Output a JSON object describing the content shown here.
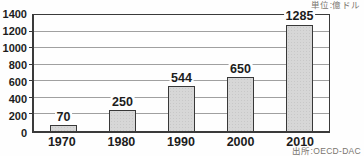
{
  "chart_data": {
    "type": "bar",
    "categories": [
      "1970",
      "1980",
      "1990",
      "2000",
      "2010"
    ],
    "values": [
      70,
      250,
      544,
      650,
      1285
    ],
    "title": "",
    "xlabel": "",
    "ylabel": "",
    "ylim": [
      0,
      1400
    ],
    "yticks": [
      0,
      200,
      400,
      600,
      800,
      1000,
      1200,
      1400
    ],
    "grid": true,
    "legend_position": "none",
    "unit_label": "単位:億ドル",
    "source_label": "出所:OECD-DAC",
    "colors": {
      "bar_fill": "#d7d7d7",
      "bar_border": "#383838",
      "grid_line": "#a0a0a0",
      "axis_border": "#3a3a3a",
      "label_text": "#1c1c1c",
      "caption_text": "#7a756e",
      "background": "#fefefe"
    }
  }
}
